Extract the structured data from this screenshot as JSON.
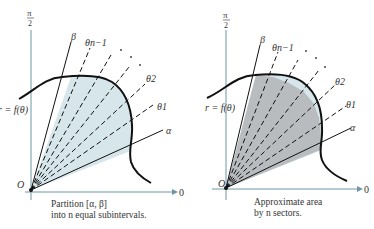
{
  "figures": [
    {
      "id": "left",
      "caption_line1": "Partition [α, β]",
      "caption_line2": "into n equal subintervals.",
      "curve_label": "r = f(θ)",
      "origin_label": "O",
      "x_axis_label": "0",
      "y_axis_label_num": "π",
      "y_axis_label_den": "2",
      "ray_labels": {
        "beta": "β",
        "theta_n_minus_1": "θn−1",
        "theta_2": "θ2",
        "theta_1": "θ1",
        "alpha": "α"
      },
      "fill_color": "#d6e6ea"
    },
    {
      "id": "right",
      "caption_line1": "Approximate area",
      "caption_line2": "by n sectors.",
      "curve_label": "r = f(θ)",
      "origin_label": "O",
      "x_axis_label": "0",
      "y_axis_label_num": "π",
      "y_axis_label_den": "2",
      "ray_labels": {
        "beta": "β",
        "theta_n_minus_1": "θn−1",
        "theta_2": "θ2",
        "theta_1": "θ1",
        "alpha": "α"
      },
      "fill_color": "#b9bcbe"
    }
  ],
  "colors": {
    "axis": "#6f96a6",
    "curve": "#111111",
    "light_fill": "#d6e6ea",
    "sector_fill": "#b9bcbe"
  }
}
